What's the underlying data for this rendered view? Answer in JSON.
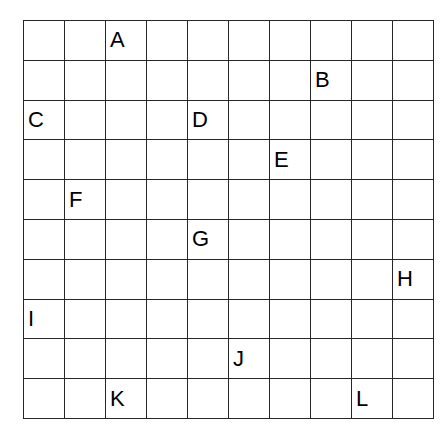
{
  "page": {
    "background_color": "#ffffff"
  },
  "grid": {
    "rows": 10,
    "columns": 10,
    "line_color": "#262626",
    "line_width_px": 1.5,
    "cell_width_px": 40,
    "cell_height_px": 38.8,
    "origin_x_px": 23,
    "origin_y_px": 20,
    "text_color": "#000000",
    "letter_alignment": "left",
    "letters": [
      {
        "label": "A",
        "row": 1,
        "column": 3
      },
      {
        "label": "B",
        "row": 2,
        "column": 8
      },
      {
        "label": "C",
        "row": 3,
        "column": 1
      },
      {
        "label": "D",
        "row": 3,
        "column": 5
      },
      {
        "label": "E",
        "row": 4,
        "column": 7
      },
      {
        "label": "F",
        "row": 5,
        "column": 2
      },
      {
        "label": "G",
        "row": 6,
        "column": 5
      },
      {
        "label": "H",
        "row": 7,
        "column": 10
      },
      {
        "label": "I",
        "row": 8,
        "column": 1
      },
      {
        "label": "J",
        "row": 9,
        "column": 6
      },
      {
        "label": "K",
        "row": 10,
        "column": 3
      },
      {
        "label": "L",
        "row": 10,
        "column": 9
      }
    ],
    "cells": [
      [
        "",
        "",
        "A",
        "",
        "",
        "",
        "",
        "",
        "",
        ""
      ],
      [
        "",
        "",
        "",
        "",
        "",
        "",
        "",
        "B",
        "",
        ""
      ],
      [
        "C",
        "",
        "",
        "",
        "D",
        "",
        "",
        "",
        "",
        ""
      ],
      [
        "",
        "",
        "",
        "",
        "",
        "",
        "E",
        "",
        "",
        ""
      ],
      [
        "",
        "F",
        "",
        "",
        "",
        "",
        "",
        "",
        "",
        ""
      ],
      [
        "",
        "",
        "",
        "",
        "G",
        "",
        "",
        "",
        "",
        ""
      ],
      [
        "",
        "",
        "",
        "",
        "",
        "",
        "",
        "",
        "",
        "H"
      ],
      [
        "I",
        "",
        "",
        "",
        "",
        "",
        "",
        "",
        "",
        ""
      ],
      [
        "",
        "",
        "",
        "",
        "",
        "J",
        "",
        "",
        "",
        ""
      ],
      [
        "",
        "",
        "K",
        "",
        "",
        "",
        "",
        "",
        "L",
        ""
      ]
    ]
  }
}
